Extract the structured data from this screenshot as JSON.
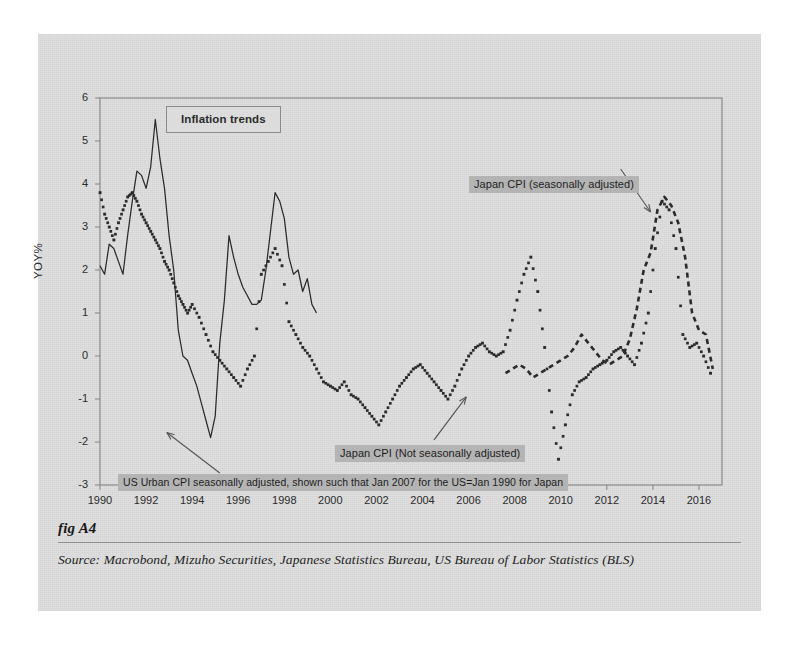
{
  "figure": {
    "number": "fig A4",
    "source": "Source:  Macrobond, Mizuho Securities, Japanese Statistics Bureau, US Bureau of Labor Statistics (BLS)"
  },
  "colors": {
    "panel_background": "#dedede",
    "plot_frame": "#8a8a8a",
    "series_ink": "#2b2b2b",
    "label_highlight": "#b4b4b4",
    "title_box_border": "#8a8a8a"
  },
  "chart_data": {
    "type": "line",
    "title": "Inflation trends",
    "xlabel": "",
    "ylabel": "YOY%",
    "xlim": [
      1990,
      2017
    ],
    "ylim": [
      -3,
      6
    ],
    "grid": false,
    "legend_position": "inline-annotations",
    "xticks": [
      "1990",
      "1992",
      "1994",
      "1996",
      "1998",
      "2000",
      "2002",
      "2004",
      "2006",
      "2008",
      "2010",
      "2012",
      "2014",
      "2016"
    ],
    "xtick_values": [
      1990,
      1992,
      1994,
      1996,
      1998,
      2000,
      2002,
      2004,
      2006,
      2008,
      2010,
      2012,
      2014,
      2016
    ],
    "yticks": [
      "6",
      "5",
      "4",
      "3",
      "2",
      "1",
      "0",
      "-1",
      "-2",
      "-3"
    ],
    "ytick_values": [
      6,
      5,
      4,
      3,
      2,
      1,
      0,
      -1,
      -2,
      -3
    ],
    "annotations": [
      {
        "id": "japan-cpi-sa",
        "text": "Japan CPI (seasonally adjusted)",
        "style": "highlighted",
        "arrow_from": [
          2012.6,
          4.35
        ],
        "arrow_to": [
          2013.9,
          3.35
        ]
      },
      {
        "id": "japan-cpi-nsa",
        "text": "Japan CPI (Not seasonally adjusted)",
        "style": "highlighted",
        "arrow_from": [
          2004.5,
          -1.95
        ],
        "arrow_to": [
          2005.9,
          -0.95
        ]
      },
      {
        "id": "us-urban-cpi",
        "text": "US Urban CPI seasonally adjusted, shown such that Jan 2007 for the US=Jan 1990 for Japan",
        "style": "highlighted",
        "arrow_from": [
          1995.2,
          -2.72
        ],
        "arrow_to": [
          1992.9,
          -1.78
        ]
      }
    ],
    "series": [
      {
        "name": "US Urban CPI seasonally adjusted, shown such that Jan 2007 for the US=Jan 1990 for Japan",
        "style": "solid",
        "x": [
          1990.0,
          1990.2,
          1990.4,
          1990.6,
          1990.8,
          1991.0,
          1991.2,
          1991.4,
          1991.6,
          1991.8,
          1992.0,
          1992.2,
          1992.4,
          1992.6,
          1992.8,
          1993.0,
          1993.2,
          1993.4,
          1993.6,
          1993.8,
          1994.0,
          1994.2,
          1994.4,
          1994.6,
          1994.8,
          1995.0,
          1995.2,
          1995.4,
          1995.6,
          1995.8,
          1996.0,
          1996.2,
          1996.4,
          1996.6,
          1996.8,
          1997.0,
          1997.2,
          1997.4,
          1997.6,
          1997.8,
          1998.0,
          1998.2,
          1998.4,
          1998.6,
          1998.8,
          1999.0,
          1999.2,
          1999.4
        ],
        "y": [
          2.1,
          1.9,
          2.6,
          2.5,
          2.2,
          1.9,
          2.8,
          3.6,
          4.3,
          4.2,
          3.9,
          4.4,
          5.5,
          4.6,
          3.9,
          2.8,
          2.0,
          0.6,
          0.0,
          -0.1,
          -0.4,
          -0.7,
          -1.1,
          -1.5,
          -1.9,
          -1.4,
          0.3,
          1.3,
          2.8,
          2.3,
          1.9,
          1.6,
          1.4,
          1.2,
          1.2,
          1.3,
          2.0,
          2.9,
          3.8,
          3.6,
          3.2,
          2.3,
          1.9,
          2.0,
          1.5,
          1.8,
          1.2,
          1.0
        ]
      },
      {
        "name": "Japan CPI (Not seasonally adjusted)",
        "style": "dotted",
        "x": [
          1990.0,
          1990.2,
          1990.4,
          1990.6,
          1990.8,
          1991.0,
          1991.2,
          1991.4,
          1991.6,
          1991.8,
          1992.0,
          1992.2,
          1992.4,
          1992.6,
          1992.8,
          1993.0,
          1993.2,
          1993.4,
          1993.6,
          1993.8,
          1994.0,
          1994.3,
          1994.6,
          1994.9,
          1995.2,
          1995.5,
          1995.8,
          1996.1,
          1996.4,
          1996.7,
          1997.0,
          1997.3,
          1997.6,
          1997.9,
          1998.2,
          1998.5,
          1998.8,
          1999.1,
          1999.4,
          1999.7,
          2000.0,
          2000.3,
          2000.6,
          2000.9,
          2001.2,
          2001.5,
          2001.8,
          2002.1,
          2002.4,
          2002.7,
          2003.0,
          2003.3,
          2003.6,
          2003.9,
          2004.2,
          2004.5,
          2004.8,
          2005.1,
          2005.4,
          2005.7,
          2006.0,
          2006.3,
          2006.6,
          2006.9,
          2007.2,
          2007.5,
          2007.8,
          2008.1,
          2008.4,
          2008.7,
          2009.0,
          2009.3,
          2009.6,
          2009.9,
          2010.2,
          2010.5,
          2010.8,
          2011.1,
          2011.4,
          2011.7,
          2012.0,
          2012.3,
          2012.6,
          2012.9,
          2013.2,
          2013.5,
          2013.8,
          2014.1,
          2014.4,
          2014.7,
          2015.0,
          2015.3,
          2015.6,
          2015.9,
          2016.2,
          2016.5
        ],
        "y": [
          3.8,
          3.3,
          3.0,
          2.7,
          3.1,
          3.4,
          3.7,
          3.8,
          3.6,
          3.3,
          3.1,
          2.9,
          2.7,
          2.5,
          2.2,
          2.0,
          1.7,
          1.4,
          1.2,
          1.0,
          1.2,
          0.9,
          0.5,
          0.1,
          -0.1,
          -0.3,
          -0.5,
          -0.7,
          -0.3,
          0.0,
          1.9,
          2.2,
          2.5,
          2.1,
          0.8,
          0.5,
          0.2,
          0.0,
          -0.3,
          -0.6,
          -0.7,
          -0.8,
          -0.6,
          -0.9,
          -1.0,
          -1.2,
          -1.4,
          -1.6,
          -1.3,
          -1.0,
          -0.7,
          -0.5,
          -0.3,
          -0.2,
          -0.4,
          -0.6,
          -0.8,
          -1.0,
          -0.7,
          -0.3,
          0.0,
          0.2,
          0.3,
          0.1,
          0.0,
          0.1,
          0.6,
          1.3,
          1.9,
          2.3,
          1.5,
          0.2,
          -1.3,
          -2.4,
          -1.6,
          -0.9,
          -0.6,
          -0.5,
          -0.3,
          -0.2,
          -0.1,
          0.1,
          0.2,
          0.0,
          -0.2,
          0.3,
          1.0,
          2.5,
          3.6,
          3.4,
          2.5,
          0.5,
          0.2,
          0.3,
          0.0,
          -0.4
        ]
      },
      {
        "name": "Japan CPI (seasonally adjusted)",
        "style": "dashed",
        "x": [
          2007.6,
          2007.9,
          2008.2,
          2008.5,
          2008.8,
          2009.1,
          2009.4,
          2009.7,
          2010.0,
          2010.3,
          2010.6,
          2010.9,
          2011.2,
          2011.5,
          2011.8,
          2012.1,
          2012.4,
          2012.7,
          2013.0,
          2013.3,
          2013.6,
          2013.9,
          2014.2,
          2014.5,
          2014.8,
          2015.1,
          2015.4,
          2015.7,
          2016.0,
          2016.3,
          2016.6
        ],
        "y": [
          -0.4,
          -0.3,
          -0.2,
          -0.3,
          -0.5,
          -0.4,
          -0.3,
          -0.2,
          -0.1,
          0.0,
          0.2,
          0.5,
          0.3,
          0.1,
          -0.1,
          -0.2,
          -0.1,
          0.0,
          0.4,
          1.1,
          2.0,
          2.4,
          3.4,
          3.7,
          3.5,
          3.1,
          2.3,
          1.0,
          0.6,
          0.5,
          -0.3
        ]
      }
    ]
  }
}
